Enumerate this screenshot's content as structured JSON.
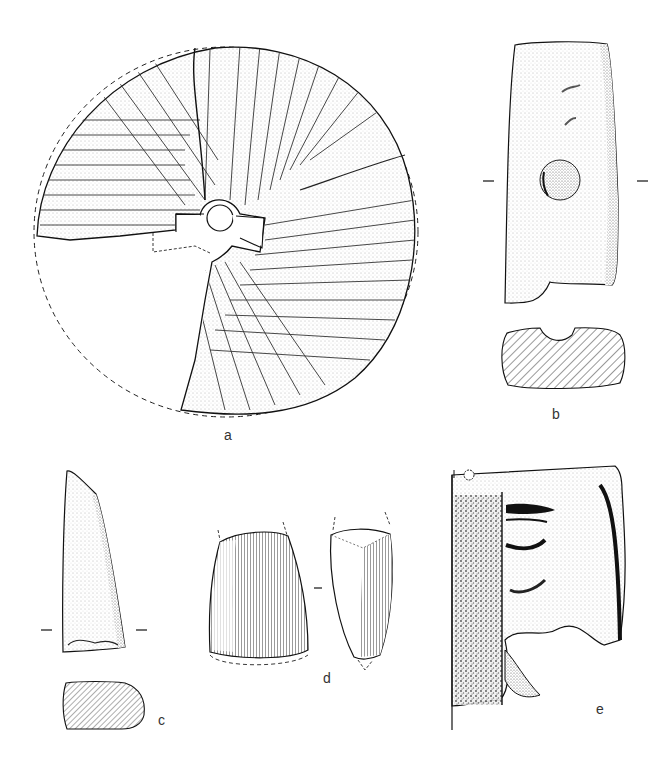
{
  "plate": {
    "figures": [
      {
        "id": "a",
        "label": "a",
        "description": "Rotary quern / millstone fragment with radial furrow dressing and central hole, reconstructed outline dashed"
      },
      {
        "id": "b",
        "label": "b",
        "description": "Rectangular stone with central circular depression, with hatched cross-section below"
      },
      {
        "id": "c",
        "label": "c",
        "description": "Tapered stone tool fragment, with hatched cross-section below"
      },
      {
        "id": "d",
        "label": "d",
        "description": "Polished stone axe, front and side views with striated surface"
      },
      {
        "id": "e",
        "label": "e",
        "description": "Sculpted relief fragment showing part of a face (mouth and chin)"
      }
    ]
  },
  "colors": {
    "ink": "#1a1a1a",
    "paper": "#ffffff",
    "stipple": "#8a8a8a"
  }
}
